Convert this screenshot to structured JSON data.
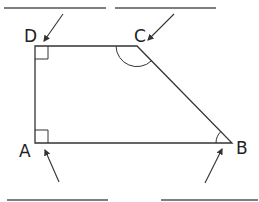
{
  "diagram": {
    "type": "trapezium-labelling",
    "shape": "right trapezium",
    "vertices": [
      {
        "label": "A",
        "x": 35,
        "y": 143,
        "angle_marker": "right-angle"
      },
      {
        "label": "B",
        "x": 232,
        "y": 143,
        "angle_marker": "acute-arc"
      },
      {
        "label": "C",
        "x": 137,
        "y": 46,
        "angle_marker": "obtuse-arc"
      },
      {
        "label": "D",
        "x": 35,
        "y": 46,
        "angle_marker": "right-angle"
      }
    ],
    "answer_blanks": [
      {
        "for": "D",
        "x1": 4,
        "y1": 8,
        "x2": 106,
        "y2": 8,
        "value": ""
      },
      {
        "for": "C",
        "x1": 115,
        "y1": 8,
        "x2": 216,
        "y2": 8,
        "value": ""
      },
      {
        "for": "A",
        "x1": 7,
        "y1": 200,
        "x2": 108,
        "y2": 200,
        "value": ""
      },
      {
        "for": "B",
        "x1": 161,
        "y1": 200,
        "x2": 258,
        "y2": 200,
        "value": ""
      }
    ],
    "colors": {
      "line": "#333333",
      "text": "#222222",
      "blank": "#555555"
    }
  }
}
